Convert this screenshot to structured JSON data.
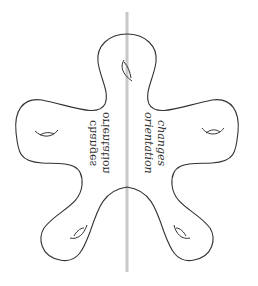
{
  "diagram": {
    "type": "surface-with-handles",
    "mirror_line_color": "#c8c8c8",
    "outline_color": "#333333",
    "labels": {
      "right_line1": "orientation",
      "right_line2": "changes",
      "left_line1": "orientation",
      "left_line2": "changes"
    },
    "handles_count": 5
  }
}
